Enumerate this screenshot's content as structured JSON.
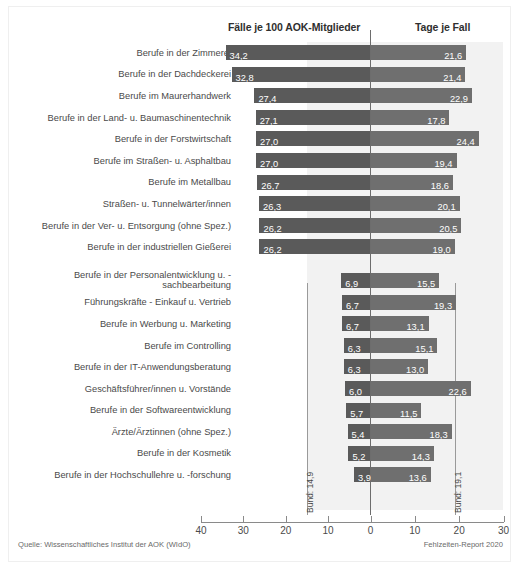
{
  "header": {
    "left_label": "Fälle je 100 AOK-Mitglieder",
    "right_label": "Tage je Fall"
  },
  "reference": {
    "left": "Bund: 14,9",
    "right": "Bund: 19,1",
    "left_value": 14.9,
    "right_value": 19.1
  },
  "footer": {
    "source": "Quelle: Wissenschaftliches Institut der AOK (WIdO)",
    "report": "Fehlzeiten-Report 2020"
  },
  "axis": {
    "ticks": [
      "40",
      "30",
      "20",
      "10",
      "0",
      "10",
      "20",
      "30"
    ]
  },
  "colors": {
    "left_bar": "#5a5a5a",
    "right_bar": "#6f6f6f",
    "band": "#f2f2f2",
    "zero_line": "#6d6d6d"
  },
  "chart_data": {
    "type": "bar",
    "orientation": "horizontal-diverging",
    "title": "",
    "xlabel": "",
    "ylabel": "",
    "left_axis_label": "Fälle je 100 AOK-Mitglieder",
    "right_axis_label": "Tage je Fall",
    "left_xlim": [
      40,
      0
    ],
    "right_xlim": [
      0,
      30
    ],
    "left_ticks": [
      40,
      30,
      20,
      10,
      0
    ],
    "right_ticks": [
      0,
      10,
      20,
      30
    ],
    "grid": false,
    "legend": "none",
    "annotations": [
      "Bund: 14,9",
      "Bund: 19,1"
    ],
    "categories": [
      "Berufe in der Zimmerei",
      "Berufe in der Dachdeckerei",
      "Berufe im Maurerhandwerk",
      "Berufe in der Land- u. Baumaschinentechnik",
      "Berufe in der Forstwirtschaft",
      "Berufe im Straßen- u. Asphaltbau",
      "Berufe im Metallbau",
      "Straßen- u. Tunnelwärter/innen",
      "Berufe in der Ver- u. Entsorgung (ohne Spez.)",
      "Berufe in der industriellen Gießerei",
      "Berufe in der Personalentwicklung u. -sachbearbeitung",
      "Führungskräfte - Einkauf u. Vertrieb",
      "Berufe in Werbung u. Marketing",
      "Berufe im Controlling",
      "Berufe in der IT-Anwendungsberatung",
      "Geschäftsführer/innen u. Vorstände",
      "Berufe in der Softwareentwicklung",
      "Ärzte/Ärztinnen (ohne Spez.)",
      "Berufe in der Kosmetik",
      "Berufe in der Hochschullehre u. -forschung"
    ],
    "series": [
      {
        "name": "Fälle je 100 AOK-Mitglieder",
        "values": [
          34.2,
          32.8,
          27.4,
          27.1,
          27.0,
          27.0,
          26.7,
          26.3,
          26.2,
          26.2,
          6.9,
          6.7,
          6.7,
          6.3,
          6.3,
          6.0,
          5.7,
          5.4,
          5.2,
          3.9
        ],
        "labels": [
          "34,2",
          "32,8",
          "27,4",
          "27,1",
          "27,0",
          "27,0",
          "26,7",
          "26,3",
          "26,2",
          "26,2",
          "6,9",
          "6,7",
          "6,7",
          "6,3",
          "6,3",
          "6,0",
          "5,7",
          "5,4",
          "5,2",
          "3,9"
        ]
      },
      {
        "name": "Tage je Fall",
        "values": [
          21.6,
          21.4,
          22.9,
          17.8,
          24.4,
          19.4,
          18.6,
          20.1,
          20.5,
          19.0,
          15.5,
          19.3,
          13.1,
          15.1,
          13.0,
          22.6,
          11.5,
          18.3,
          14.3,
          13.6
        ],
        "labels": [
          "21,6",
          "21,4",
          "22,9",
          "17,8",
          "24,4",
          "19,4",
          "18,6",
          "20,1",
          "20,5",
          "19,0",
          "15,5",
          "19,3",
          "13,1",
          "15,1",
          "13,0",
          "22,6",
          "11,5",
          "18,3",
          "14,3",
          "13,6"
        ]
      }
    ],
    "group_break_after_index": 9
  }
}
